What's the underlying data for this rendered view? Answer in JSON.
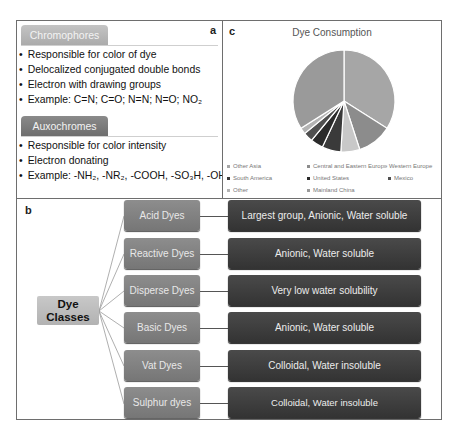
{
  "panel_a": {
    "letter": "a",
    "chromophores": {
      "title": "Chromophores",
      "bullets": [
        "Responsible for color of dye",
        "Delocalized conjugated double bonds",
        "Electron with drawing groups",
        "Example: C=N; C=O; N=N; N=O; NO₂"
      ]
    },
    "auxochromes": {
      "title": "Auxochromes",
      "bullets": [
        "Responsible for color intensity",
        "Electron donating",
        "Example: -NH₂, -NR₂, -COOH, -SO₃H, -OH"
      ]
    }
  },
  "panel_c": {
    "letter": "c",
    "title": "Dye Consumption",
    "legend": [
      {
        "label": "Other Asia",
        "color": "#a6a6a6"
      },
      {
        "label": "Central and Eastern Europe",
        "color": "#8c8c8c"
      },
      {
        "label": "Western Europe",
        "color": "#c8c8c8"
      },
      {
        "label": "South America",
        "color": "#3a3a3a"
      },
      {
        "label": "United States",
        "color": "#2a2a2a"
      },
      {
        "label": "Mexico",
        "color": "#505050"
      },
      {
        "label": "Other",
        "color": "#b4b4b4"
      },
      {
        "label": "Mainland China",
        "color": "#9a9a9a"
      }
    ]
  },
  "chart_data": {
    "type": "pie",
    "title": "Dye Consumption",
    "categories": [
      "Other Asia",
      "Central and Eastern Europe",
      "Western Europe",
      "South America",
      "United States",
      "Mexico",
      "Other",
      "Mainland China"
    ],
    "values": [
      34,
      11,
      6,
      6,
      4,
      3,
      2,
      34
    ],
    "colors": [
      "#a6a6a6",
      "#8c8c8c",
      "#c8c8c8",
      "#3a3a3a",
      "#2a2a2a",
      "#505050",
      "#b4b4b4",
      "#9a9a9a"
    ],
    "legend_position": "bottom",
    "unit": "percent (estimated)"
  },
  "panel_b": {
    "letter": "b",
    "root": {
      "line1": "Dye",
      "line2": "Classes"
    },
    "classes": [
      {
        "name": "Acid Dyes",
        "description": "Largest group, Anionic, Water soluble"
      },
      {
        "name": "Reactive Dyes",
        "description": "Anionic, Water soluble"
      },
      {
        "name": "Disperse Dyes",
        "description": "Very low water solubility"
      },
      {
        "name": "Basic Dyes",
        "description": "Anionic, Water soluble"
      },
      {
        "name": "Vat Dyes",
        "description": "Colloidal, Water insoluble"
      },
      {
        "name": "Sulphur dyes",
        "description": "Colloidal, Water insoluble"
      }
    ]
  }
}
